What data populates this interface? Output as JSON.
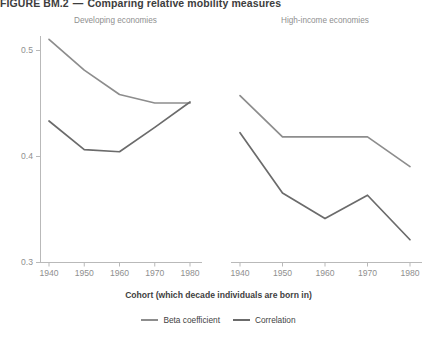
{
  "figure": {
    "number": "FIGURE BM.2",
    "dash": "—",
    "title": "Comparing relative mobility measures"
  },
  "panels": {
    "left_title": "Developing economies",
    "right_title": "High-income economies"
  },
  "axis": {
    "x_label": "Cohort (which decade individuals are born in)",
    "y_ticks": [
      "0.5",
      "0.4",
      "0.3"
    ],
    "x_ticks": [
      "1940",
      "1950",
      "1960",
      "1970",
      "1980"
    ]
  },
  "legend": {
    "items": [
      {
        "label": "Beta coefficient",
        "color": "#8d8d8d"
      },
      {
        "label": "Correlation",
        "color": "#6b6b6b"
      }
    ]
  },
  "colors": {
    "beta": "#8d8d8d",
    "correlation": "#6b6b6b",
    "axis": "#b9b9b9",
    "tick_text": "#8f8f8f"
  },
  "chart_data": {
    "type": "line",
    "xlabel": "Cohort (which decade individuals are born in)",
    "ylabel": "",
    "x": [
      1940,
      1950,
      1960,
      1970,
      1980
    ],
    "ylim": [
      0.3,
      0.52
    ],
    "xlim": [
      1935,
      1985
    ],
    "grid": false,
    "legend_position": "bottom-center",
    "panels": [
      {
        "name": "Developing economies",
        "series": [
          {
            "name": "Beta coefficient",
            "color": "#8d8d8d",
            "values": [
              0.51,
              0.481,
              0.458,
              0.45,
              0.45
            ]
          },
          {
            "name": "Correlation",
            "color": "#6b6b6b",
            "values": [
              0.433,
              0.406,
              0.404,
              0.427,
              0.451
            ]
          }
        ]
      },
      {
        "name": "High-income economies",
        "series": [
          {
            "name": "Beta coefficient",
            "color": "#8d8d8d",
            "values": [
              0.457,
              0.418,
              0.418,
              0.418,
              0.39
            ]
          },
          {
            "name": "Correlation",
            "color": "#6b6b6b",
            "values": [
              0.422,
              0.365,
              0.341,
              0.363,
              0.321
            ]
          }
        ]
      }
    ]
  }
}
